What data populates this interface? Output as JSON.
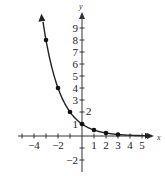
{
  "chart_data": {
    "type": "line",
    "title": "",
    "xlabel": "x",
    "ylabel": "y",
    "function": "y = (1/2)^x",
    "points": [
      {
        "x": -3,
        "y": 8
      },
      {
        "x": -2,
        "y": 4
      },
      {
        "x": -1,
        "y": 2
      },
      {
        "x": 0,
        "y": 1
      },
      {
        "x": 1,
        "y": 0.5
      },
      {
        "x": 2,
        "y": 0.25
      },
      {
        "x": 3,
        "y": 0.125
      }
    ],
    "x_tick_labels": [
      "-4",
      "-2",
      "1",
      "2",
      "3",
      "4",
      "5"
    ],
    "y_tick_labels": [
      "9",
      "8",
      "7",
      "6",
      "5",
      "4",
      "3",
      "1",
      "-2"
    ],
    "annotations": [
      "2"
    ],
    "xlim": [
      -5,
      6
    ],
    "ylim": [
      -3,
      10
    ],
    "grid": false,
    "legend": null
  },
  "labels": {
    "x_axis": "x",
    "y_axis": "y",
    "x_ticks": [
      {
        "value": -4,
        "text": "−4"
      },
      {
        "value": -2,
        "text": "−2"
      },
      {
        "value": 1,
        "text": "1"
      },
      {
        "value": 2,
        "text": "2"
      },
      {
        "value": 3,
        "text": "3"
      },
      {
        "value": 4,
        "text": "4"
      },
      {
        "value": 5,
        "text": "5"
      }
    ],
    "y_ticks": [
      {
        "value": 9,
        "text": "9"
      },
      {
        "value": 8,
        "text": "8"
      },
      {
        "value": 7,
        "text": "7"
      },
      {
        "value": 6,
        "text": "6"
      },
      {
        "value": 5,
        "text": "5"
      },
      {
        "value": 4,
        "text": "4"
      },
      {
        "value": 3,
        "text": "3"
      },
      {
        "value": 1,
        "text": "1"
      },
      {
        "value": -2,
        "text": "−2"
      }
    ],
    "annotation": "2"
  }
}
